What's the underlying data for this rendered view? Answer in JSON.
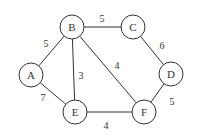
{
  "graph": {
    "nodes": [
      {
        "id": "A",
        "label": "A"
      },
      {
        "id": "B",
        "label": "B"
      },
      {
        "id": "C",
        "label": "C"
      },
      {
        "id": "D",
        "label": "D"
      },
      {
        "id": "E",
        "label": "E"
      },
      {
        "id": "F",
        "label": "F"
      }
    ],
    "edges": [
      {
        "from": "A",
        "to": "B",
        "weight": "5"
      },
      {
        "from": "A",
        "to": "E",
        "weight": "7"
      },
      {
        "from": "B",
        "to": "C",
        "weight": "5"
      },
      {
        "from": "B",
        "to": "E",
        "weight": "3"
      },
      {
        "from": "B",
        "to": "F",
        "weight": "4"
      },
      {
        "from": "C",
        "to": "D",
        "weight": "6"
      },
      {
        "from": "D",
        "to": "F",
        "weight": "5"
      },
      {
        "from": "E",
        "to": "F",
        "weight": "4"
      }
    ]
  }
}
